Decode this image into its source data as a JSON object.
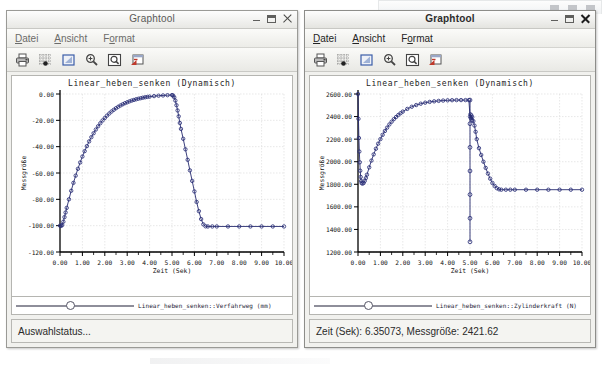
{
  "background_window": {
    "name": "partially-hidden-window"
  },
  "windows": [
    {
      "id": "left",
      "active": false,
      "title": "Graphtool",
      "window_buttons": {
        "minimize": "minimize",
        "maximize": "maximize",
        "close": "close"
      },
      "menu": [
        {
          "label": "Datei",
          "mnemonic": "D"
        },
        {
          "label": "Ansicht",
          "mnemonic": "A"
        },
        {
          "label": "Format",
          "mnemonic": "o"
        }
      ],
      "toolbar": [
        {
          "name": "print-icon",
          "tip": "Drucken"
        },
        {
          "name": "grid-icon",
          "tip": "Raster"
        },
        {
          "name": "zoom-region-icon",
          "tip": "Bereich"
        },
        {
          "name": "zoom-in-icon",
          "tip": "Vergrößern"
        },
        {
          "name": "zoom-fit-icon",
          "tip": "Anpassen"
        },
        {
          "name": "export-icon",
          "tip": "Export"
        }
      ],
      "legend": "Linear_heben_senken::Verfahrweg (mm)",
      "status": "Auswahlstatus..."
    },
    {
      "id": "right",
      "active": true,
      "title": "Graphtool",
      "window_buttons": {
        "minimize": "minimize",
        "maximize": "maximize",
        "close": "close"
      },
      "menu": [
        {
          "label": "Datei",
          "mnemonic": "D"
        },
        {
          "label": "Ansicht",
          "mnemonic": "A"
        },
        {
          "label": "Format",
          "mnemonic": "o"
        }
      ],
      "toolbar": [
        {
          "name": "print-icon",
          "tip": "Drucken"
        },
        {
          "name": "grid-icon",
          "tip": "Raster"
        },
        {
          "name": "zoom-region-icon",
          "tip": "Bereich"
        },
        {
          "name": "zoom-in-icon",
          "tip": "Vergrößern"
        },
        {
          "name": "zoom-fit-icon",
          "tip": "Anpassen"
        },
        {
          "name": "export-icon",
          "tip": "Export"
        }
      ],
      "legend": "Linear_heben_senken::Zylinderkraft (N)",
      "status": "Zeit (Sek): 6.35073, Messgröße: 2421.62"
    }
  ],
  "colors": {
    "series": "#262a6e",
    "marker_edge": "#2b2f78",
    "axis": "#000000",
    "grid": "#d9d9d9",
    "window_bg": "#f1f1ee",
    "plot_bg": "#ffffff"
  },
  "chart_data": [
    {
      "id": "left-chart",
      "type": "line",
      "title": "Linear_heben_senken (Dynamisch)",
      "xlabel": "Zeit (Sek)",
      "ylabel": "Messgröße",
      "legend": "Linear_heben_senken::Verfahrweg (mm)",
      "legend_position": "below-axis",
      "grid": true,
      "xlim": [
        0.0,
        10.0
      ],
      "ylim": [
        -120.0,
        0.0
      ],
      "xticks": [
        "0.00",
        "1.00",
        "2.00",
        "3.00",
        "4.00",
        "5.00",
        "6.00",
        "7.00",
        "8.00",
        "9.00",
        "10.00"
      ],
      "yticks": [
        "0.00",
        "-20.00",
        "-40.00",
        "-60.00",
        "-80.00",
        "-100.00",
        "-120.00"
      ],
      "markers": "circle",
      "series": [
        {
          "name": "Verfahrweg (mm)",
          "x": [
            0.0,
            0.05,
            0.1,
            0.15,
            0.2,
            0.25,
            0.3,
            0.4,
            0.5,
            0.6,
            0.7,
            0.8,
            0.9,
            1.0,
            1.1,
            1.2,
            1.3,
            1.4,
            1.5,
            1.6,
            1.7,
            1.8,
            1.9,
            2.0,
            2.1,
            2.2,
            2.3,
            2.4,
            2.5,
            2.6,
            2.7,
            2.8,
            2.9,
            3.0,
            3.1,
            3.2,
            3.3,
            3.4,
            3.5,
            3.6,
            3.7,
            3.8,
            3.9,
            4.0,
            4.2,
            4.4,
            4.6,
            4.8,
            5.0,
            5.05,
            5.1,
            5.15,
            5.2,
            5.25,
            5.3,
            5.35,
            5.4,
            5.5,
            5.6,
            5.7,
            5.8,
            5.9,
            6.0,
            6.1,
            6.2,
            6.3,
            6.4,
            6.5,
            6.6,
            6.8,
            7.0,
            7.5,
            8.0,
            8.5,
            9.0,
            9.5,
            10.0
          ],
          "y": [
            -100.0,
            -100.2,
            -99.5,
            -97.0,
            -93.5,
            -90.0,
            -86.5,
            -80.0,
            -73.5,
            -67.5,
            -62.0,
            -56.8,
            -52.0,
            -47.5,
            -43.4,
            -39.6,
            -36.0,
            -32.8,
            -29.8,
            -27.0,
            -24.5,
            -22.2,
            -20.1,
            -18.2,
            -16.4,
            -14.8,
            -13.3,
            -12.0,
            -10.8,
            -9.7,
            -8.7,
            -7.8,
            -7.0,
            -6.3,
            -5.6,
            -5.0,
            -4.5,
            -4.0,
            -3.6,
            -3.2,
            -2.8,
            -2.5,
            -2.2,
            -2.0,
            -1.6,
            -1.3,
            -1.1,
            -0.9,
            -0.8,
            -1.2,
            -2.5,
            -5.0,
            -8.5,
            -12.5,
            -17.0,
            -22.0,
            -26.5,
            -34.0,
            -42.0,
            -50.0,
            -58.0,
            -66.0,
            -74.0,
            -82.0,
            -89.0,
            -95.0,
            -99.0,
            -100.5,
            -100.6,
            -100.6,
            -100.6,
            -100.6,
            -100.6,
            -100.6,
            -100.6,
            -100.6,
            -100.6
          ]
        }
      ]
    },
    {
      "id": "right-chart",
      "type": "line",
      "title": "Linear_heben_senken (Dynamisch)",
      "xlabel": "Zeit (Sek)",
      "ylabel": "Messgröße",
      "legend": "Linear_heben_senken::Zylinderkraft (N)",
      "legend_position": "below-axis",
      "grid": true,
      "xlim": [
        0.0,
        10.0
      ],
      "ylim": [
        1200.0,
        2600.0
      ],
      "xticks": [
        "0.00",
        "1.00",
        "2.00",
        "3.00",
        "4.00",
        "5.00",
        "6.00",
        "7.00",
        "8.00",
        "9.00",
        "10.00"
      ],
      "yticks": [
        "2600.00",
        "2400.00",
        "2200.00",
        "2000.00",
        "1800.00",
        "1600.00",
        "1400.00",
        "1200.00"
      ],
      "markers": "circle",
      "cursor_readout": {
        "x": 6.35073,
        "y": 2421.62
      },
      "series": [
        {
          "name": "Zylinderkraft (N)",
          "x": [
            0.0,
            0.02,
            0.04,
            0.06,
            0.08,
            0.1,
            0.12,
            0.14,
            0.16,
            0.2,
            0.25,
            0.3,
            0.35,
            0.4,
            0.5,
            0.6,
            0.7,
            0.8,
            0.9,
            1.0,
            1.1,
            1.2,
            1.3,
            1.4,
            1.5,
            1.6,
            1.7,
            1.8,
            1.9,
            2.0,
            2.2,
            2.4,
            2.6,
            2.8,
            3.0,
            3.2,
            3.4,
            3.6,
            3.8,
            4.0,
            4.2,
            4.4,
            4.6,
            4.8,
            4.95,
            5.0,
            5.02,
            5.04,
            5.06,
            5.08,
            5.1,
            5.15,
            5.2,
            5.25,
            5.3,
            5.4,
            5.5,
            5.6,
            5.7,
            5.8,
            5.9,
            6.0,
            6.1,
            6.2,
            6.3,
            6.4,
            6.6,
            6.8,
            7.0,
            7.5,
            8.0,
            8.5,
            9.0,
            9.5,
            10.0
          ],
          "y": [
            2600.0,
            2380.0,
            2210.0,
            2090.0,
            1995.0,
            1920.0,
            1865.0,
            1830.0,
            1812.0,
            1805.0,
            1812.0,
            1830.0,
            1855.0,
            1885.0,
            1950.0,
            2010.0,
            2065.0,
            2115.0,
            2160.0,
            2200.0,
            2238.0,
            2272.0,
            2302.0,
            2330.0,
            2354.0,
            2377.0,
            2396.0,
            2414.0,
            2430.0,
            2444.0,
            2468.0,
            2487.0,
            2502.0,
            2514.0,
            2523.0,
            2530.0,
            2535.0,
            2539.0,
            2542.0,
            2544.0,
            2545.0,
            2546.0,
            2546.0,
            2546.0,
            2546.0,
            2400.0,
            2420.0,
            2385.0,
            2410.0,
            2370.0,
            2395.0,
            2360.0,
            2320.0,
            2265.0,
            2200.0,
            2120.0,
            2060.0,
            2000.0,
            1945.0,
            1895.0,
            1850.0,
            1812.0,
            1785.0,
            1765.0,
            1755.0,
            1752.0,
            1752.0,
            1752.0,
            1752.0,
            1752.0,
            1752.0,
            1752.0,
            1752.0,
            1752.0,
            1752.0
          ]
        },
        {
          "name": "cursor-dropline",
          "x": [
            5.0,
            5.0
          ],
          "y": [
            2546.0,
            1290.0
          ]
        }
      ]
    }
  ]
}
